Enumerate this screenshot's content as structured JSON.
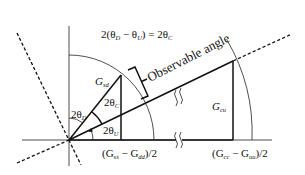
{
  "diagram": {
    "equation": {
      "prefix": "2(θ",
      "sub1": "D",
      "mid": " − θ",
      "sub2": "U",
      "suffix": ") = 2θ",
      "sub3": "C"
    },
    "observable_label": "Observable angle",
    "labels": {
      "g_sd": {
        "main": "G",
        "sub": "sd"
      },
      "g_cu": {
        "main": "G",
        "sub": "cu"
      },
      "theta_d": {
        "main": "2θ",
        "sub": "D"
      },
      "theta_c": {
        "main": "2θ",
        "sub": "C"
      },
      "theta_u": {
        "main": "2θ",
        "sub": "U"
      },
      "x_left": {
        "open": "(G",
        "sub1": "ss",
        "mid": " − G",
        "sub2": "dd",
        "close": ")/2"
      },
      "x_right": {
        "open": "(G",
        "sub1": "cc",
        "mid": " − G",
        "sub2": "uu",
        "close": ")/2"
      }
    },
    "colors": {
      "line": "#111111",
      "background": "#ffffff"
    }
  }
}
